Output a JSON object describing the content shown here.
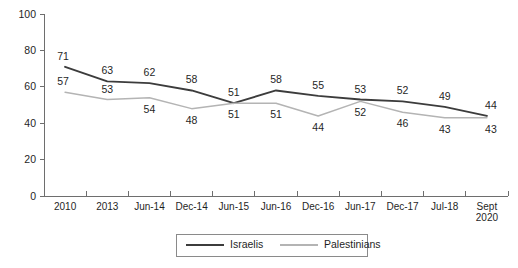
{
  "chart_data": {
    "type": "line",
    "title": "",
    "xlabel": "",
    "ylabel": "",
    "ylim": [
      0,
      100
    ],
    "yticks": [
      0,
      20,
      40,
      60,
      80,
      100
    ],
    "grid": false,
    "legend_position": "bottom-center",
    "categories": [
      "2010",
      "2013",
      "Jun-14",
      "Dec-14",
      "Jun-15",
      "Jun-16",
      "Dec-16",
      "Jun-17",
      "Dec-17",
      "Jul-18",
      "Sept\n2020"
    ],
    "category_labels": [
      {
        "line1": "2010",
        "line2": ""
      },
      {
        "line1": "2013",
        "line2": ""
      },
      {
        "line1": "Jun-14",
        "line2": ""
      },
      {
        "line1": "Dec-14",
        "line2": ""
      },
      {
        "line1": "Jun-15",
        "line2": ""
      },
      {
        "line1": "Jun-16",
        "line2": ""
      },
      {
        "line1": "Dec-16",
        "line2": ""
      },
      {
        "line1": "Jun-17",
        "line2": ""
      },
      {
        "line1": "Dec-17",
        "line2": ""
      },
      {
        "line1": "Jul-18",
        "line2": ""
      },
      {
        "line1": "Sept",
        "line2": "2020"
      }
    ],
    "series": [
      {
        "name": "Israelis",
        "color": "#3c3c3c",
        "values": [
          71,
          63,
          62,
          58,
          51,
          58,
          55,
          53,
          52,
          49,
          44
        ],
        "label_side": [
          "above",
          "above",
          "above",
          "above",
          "above",
          "above",
          "above",
          "above",
          "above",
          "above",
          "above"
        ]
      },
      {
        "name": "Palestinians",
        "color": "#b4b4b4",
        "values": [
          57,
          53,
          54,
          48,
          51,
          51,
          44,
          52,
          46,
          43,
          43
        ],
        "label_side": [
          "above",
          "above",
          "below",
          "below",
          "below",
          "below",
          "below",
          "below",
          "below",
          "below",
          "below"
        ]
      }
    ]
  },
  "legend": {
    "entries": [
      {
        "label": "Israelis"
      },
      {
        "label": "Palestinians"
      }
    ]
  },
  "axis": {
    "y_tick_labels": [
      "0",
      "20",
      "40",
      "60",
      "80",
      "100"
    ]
  }
}
